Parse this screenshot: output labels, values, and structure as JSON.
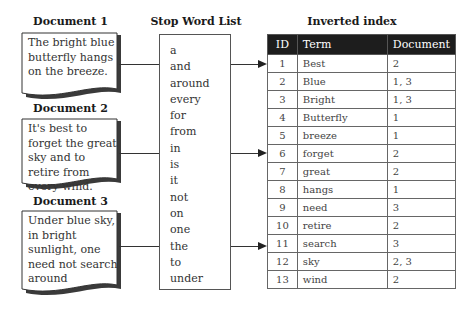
{
  "documents": [
    {
      "label": "Document 1",
      "text": "The bright blue butterfly hangs on the breeze."
    },
    {
      "label": "Document 2",
      "text": "It's best to forget the great sky and to retire from every wind."
    },
    {
      "label": "Document 3",
      "text": "Under blue sky, in bright sunlight, one need not search around"
    }
  ],
  "stop_word_list": {
    "title": "Stop Word List",
    "words": [
      "a",
      "and",
      "around",
      "every",
      "for",
      "from",
      "in",
      "is",
      "it",
      "not",
      "on",
      "one",
      "the",
      "to",
      "under"
    ]
  },
  "inverted_index": {
    "title": "Inverted index",
    "columns": [
      "ID",
      "Term",
      "Document"
    ],
    "rows": [
      {
        "id": "1",
        "term": "Best",
        "docs": "2"
      },
      {
        "id": "2",
        "term": "Blue",
        "docs": "1, 3"
      },
      {
        "id": "3",
        "term": "Bright",
        "docs": "1, 3"
      },
      {
        "id": "4",
        "term": "Butterfly",
        "docs": "1"
      },
      {
        "id": "5",
        "term": "breeze",
        "docs": "1"
      },
      {
        "id": "6",
        "term": "forget",
        "docs": "2"
      },
      {
        "id": "7",
        "term": "great",
        "docs": "2"
      },
      {
        "id": "8",
        "term": "hangs",
        "docs": "1"
      },
      {
        "id": "9",
        "term": "need",
        "docs": "3"
      },
      {
        "id": "10",
        "term": "retire",
        "docs": "2"
      },
      {
        "id": "11",
        "term": "search",
        "docs": "3"
      },
      {
        "id": "12",
        "term": "sky",
        "docs": "2, 3"
      },
      {
        "id": "13",
        "term": "wind",
        "docs": "2"
      }
    ]
  }
}
